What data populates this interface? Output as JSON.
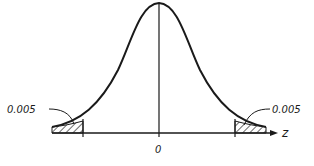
{
  "diagram": {
    "type": "normal-distribution-two-tailed",
    "axis_label": "z",
    "center_label": "0",
    "left_tail_label": "0.005",
    "right_tail_label": "0.005",
    "colors": {
      "stroke": "#1a1a1a",
      "background": "#ffffff"
    }
  }
}
